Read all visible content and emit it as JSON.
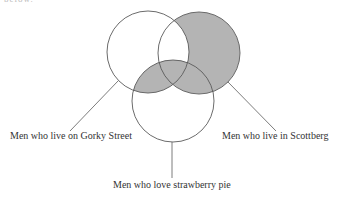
{
  "header_fragment": "below.",
  "diagram": {
    "type": "venn",
    "colors": {
      "shade": "#b4b4b4",
      "stroke": "#5a5a5a",
      "text": "#333333",
      "background": "#ffffff"
    },
    "sets": [
      {
        "id": "gorky",
        "label": "Men who live on Gorky Street",
        "cx": 148,
        "cy": 52,
        "r": 41
      },
      {
        "id": "scottberg",
        "label": "Men who live in Scottberg",
        "cx": 199,
        "cy": 53,
        "r": 41
      },
      {
        "id": "strawberry",
        "label": "Men who love strawberry pie",
        "cx": 173,
        "cy": 101,
        "r": 41
      }
    ],
    "shaded_regions": [
      "Scottberg only",
      "Scottberg and strawberry pie (not Gorky)",
      "Gorky and strawberry pie (not Scottberg)",
      "All three sets"
    ],
    "unshaded_regions": [
      "Gorky only",
      "Strawberry pie only",
      "Gorky and Scottberg (not strawberry pie)"
    ]
  },
  "labels": {
    "gorky": "Men who live on Gorky Street",
    "scottberg": "Men who live in Scottberg",
    "strawberry": "Men who love strawberry pie"
  }
}
